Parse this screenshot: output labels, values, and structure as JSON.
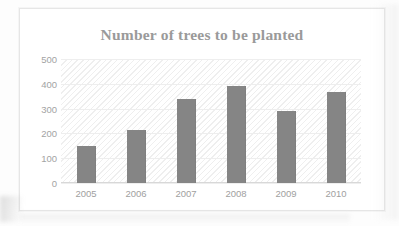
{
  "chart_data": {
    "type": "bar",
    "title": "Number of trees to be planted",
    "xlabel": "",
    "ylabel": "",
    "categories": [
      "2005",
      "2006",
      "2007",
      "2008",
      "2009",
      "2010"
    ],
    "values": [
      150,
      215,
      340,
      390,
      290,
      365
    ],
    "ylim": [
      0,
      500
    ],
    "ytick_labels": [
      "500",
      "400",
      "300",
      "200",
      "100",
      "0"
    ],
    "ytick_values": [
      500,
      400,
      300,
      200,
      100,
      0
    ],
    "ystep": 100,
    "grid": true,
    "legend": null,
    "series": [
      {
        "name": "Trees to be planted",
        "values": [
          150,
          215,
          340,
          390,
          290,
          365
        ]
      }
    ],
    "colors": {
      "bar": "#858585",
      "title": "#9a9a9a",
      "tick_label": "#a3a3a3",
      "gridline": "#eeeeee",
      "plot_background": "#ffffff",
      "frame_border": "#e6e6e6",
      "page_background": "#fdfdfd"
    }
  }
}
